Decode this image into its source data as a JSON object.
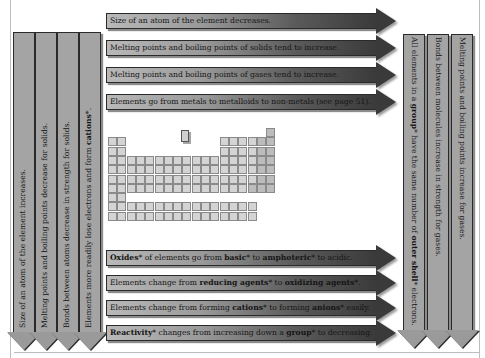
{
  "top_arrows": [
    {
      "text": "Size of an atom of the element decreases."
    },
    {
      "text": "Melting points and boiling points of solids tend to increase."
    },
    {
      "text": "Melting points and boiling points of gases tend to increase."
    },
    {
      "text": "Elements go from metals to metalloids to non-metals (see page 51)."
    }
  ],
  "bottom_arrows": [
    {
      "parts": [
        {
          "t": "Oxides",
          "b": true
        },
        {
          "t": "* of elements go from ",
          "b": false
        },
        {
          "t": "basic",
          "b": true
        },
        {
          "t": "* to ",
          "b": false
        },
        {
          "t": "amphoteric",
          "b": true
        },
        {
          "t": "* to acidic.",
          "b": false
        }
      ]
    },
    {
      "parts": [
        {
          "t": "Elements change from ",
          "b": false
        },
        {
          "t": "reducing agents",
          "b": true
        },
        {
          "t": "* to ",
          "b": false
        },
        {
          "t": "oxidizing agents",
          "b": true
        },
        {
          "t": "*.",
          "b": false
        }
      ]
    },
    {
      "parts": [
        {
          "t": "Elements change from forming ",
          "b": false
        },
        {
          "t": "cations",
          "b": true
        },
        {
          "t": "* to forming ",
          "b": false
        },
        {
          "t": "anions",
          "b": true
        },
        {
          "t": "* easily.",
          "b": false
        }
      ]
    },
    {
      "parts": [
        {
          "t": "Reactivity",
          "b": true
        },
        {
          "t": "* changes from increasing down a ",
          "b": false
        },
        {
          "t": "group",
          "b": true
        },
        {
          "t": "* to decreasing.",
          "b": false
        }
      ]
    }
  ],
  "left_arrows": [
    {
      "parts": [
        {
          "t": "Size of an atom of the element increases.",
          "b": false
        }
      ]
    },
    {
      "parts": [
        {
          "t": "Melting points and boiling points decrease for solids.",
          "b": false
        }
      ]
    },
    {
      "parts": [
        {
          "t": "Bonds between atoms decrease in strength for solids.",
          "b": false
        }
      ]
    },
    {
      "parts": [
        {
          "t": "Elements more readily lose electrons and form ",
          "b": false
        },
        {
          "t": "cations",
          "b": true
        },
        {
          "t": "*.",
          "b": false
        }
      ]
    }
  ],
  "right_arrows": [
    {
      "parts": [
        {
          "t": "All elements in a ",
          "b": false
        },
        {
          "t": "group",
          "b": true
        },
        {
          "t": "* have the same number of ",
          "b": false
        },
        {
          "t": "outer shell",
          "b": true
        },
        {
          "t": "* electrons.",
          "b": false
        }
      ]
    },
    {
      "parts": [
        {
          "t": "Bonds between molecules increase in strength for gases.",
          "b": false
        }
      ]
    },
    {
      "parts": [
        {
          "t": "Melting points and boiling points increase for gases.",
          "b": false
        }
      ]
    }
  ],
  "periodic_table": {
    "label": "Periodic table of the elements (miniature)",
    "key_cell": "H"
  },
  "colors": {
    "arrow_light": "#b9b9b9",
    "arrow_dark": "#3a3a3a",
    "vertical_arrow": "#a4a4a4",
    "outline": "#2a2a2a",
    "background": "#ffffff"
  }
}
